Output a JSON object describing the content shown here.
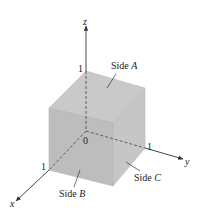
{
  "diagram": {
    "axes": {
      "x": {
        "label": "x",
        "tick": "1"
      },
      "y": {
        "label": "y",
        "tick": "1"
      },
      "z": {
        "label": "z",
        "tick": "1"
      },
      "origin": "0"
    },
    "sides": {
      "a": {
        "prefix": "Side ",
        "letter": "A"
      },
      "b": {
        "prefix": "Side ",
        "letter": "B"
      },
      "c": {
        "prefix": "Side ",
        "letter": "C"
      }
    },
    "colors": {
      "top": "#c9c9c9",
      "front": "#bdbdbd",
      "right": "#c4c4c4",
      "edge": "#b0b0b0",
      "axis": "#333333"
    }
  }
}
